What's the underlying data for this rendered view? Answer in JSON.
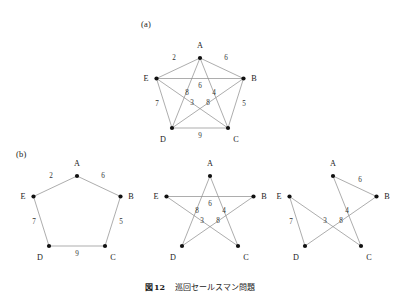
{
  "figure": {
    "caption_prefix": "図",
    "caption_number": "12",
    "caption_title": "巡回セールスマン問題",
    "panel_a_tag": "(a)",
    "panel_b_tag": "(b)",
    "ink_color": "#8a8a8a",
    "node_color": "#111111",
    "background": "#ffffff"
  },
  "chart_data": {
    "type": "diagram",
    "nodes": [
      "A",
      "B",
      "C",
      "D",
      "E"
    ],
    "panels": [
      {
        "id": "a",
        "tag": "(a)",
        "layout": "pentagon",
        "node_positions": {
          "A": [
            200,
            58
          ],
          "B": [
            243.5,
            78.5
          ],
          "C": [
            228,
            128
          ],
          "D": [
            172,
            128
          ],
          "E": [
            156.5,
            78.5
          ]
        },
        "edges": [
          {
            "from": "A",
            "to": "E",
            "weight": 2,
            "label_pos": [
              174,
              60
            ]
          },
          {
            "from": "A",
            "to": "B",
            "weight": 6,
            "label_pos": [
              226,
              60
            ]
          },
          {
            "from": "E",
            "to": "D",
            "weight": 7,
            "label_pos": [
              157,
              106
            ]
          },
          {
            "from": "B",
            "to": "C",
            "weight": 5,
            "label_pos": [
              244,
              106
            ]
          },
          {
            "from": "D",
            "to": "C",
            "weight": 9,
            "label_pos": [
              200,
              138
            ]
          },
          {
            "from": "A",
            "to": "C",
            "weight": 4,
            "label_pos": [
              214,
              95
            ]
          },
          {
            "from": "A",
            "to": "D",
            "weight": 8,
            "label_pos": [
              187,
              95
            ]
          },
          {
            "from": "B",
            "to": "E",
            "weight": 6,
            "label_pos": [
              200,
              88
            ]
          },
          {
            "from": "B",
            "to": "D",
            "weight": 8,
            "label_pos": [
              208,
              105
            ]
          },
          {
            "from": "C",
            "to": "E",
            "weight": 3,
            "label_pos": [
              192,
              105
            ]
          }
        ],
        "vertex_label_pos": {
          "A": [
            200,
            48
          ],
          "B": [
            254,
            81
          ],
          "C": [
            236,
            142
          ],
          "D": [
            163,
            142
          ],
          "E": [
            146,
            81
          ]
        }
      },
      {
        "id": "b-left",
        "tag": "(b)",
        "layout": "pentagon-cycle",
        "node_positions": {
          "A": [
            77,
            176
          ],
          "B": [
            120.5,
            196.5
          ],
          "C": [
            105,
            246
          ],
          "D": [
            49,
            246
          ],
          "E": [
            33.5,
            196.5
          ]
        },
        "edges": [
          {
            "from": "A",
            "to": "E",
            "weight": 2,
            "label_pos": [
              51,
              178
            ]
          },
          {
            "from": "A",
            "to": "B",
            "weight": 6,
            "label_pos": [
              103,
              178
            ]
          },
          {
            "from": "E",
            "to": "D",
            "weight": 7,
            "label_pos": [
              34,
              224
            ]
          },
          {
            "from": "B",
            "to": "C",
            "weight": 5,
            "label_pos": [
              121,
              224
            ]
          },
          {
            "from": "D",
            "to": "C",
            "weight": 9,
            "label_pos": [
              77,
              256
            ]
          }
        ],
        "vertex_label_pos": {
          "A": [
            77,
            166
          ],
          "B": [
            131,
            199
          ],
          "C": [
            113,
            260
          ],
          "D": [
            40,
            260
          ],
          "E": [
            23,
            199
          ]
        }
      },
      {
        "id": "b-middle",
        "tag": "",
        "layout": "pentagram",
        "node_positions": {
          "A": [
            210,
            176
          ],
          "B": [
            253.5,
            196.5
          ],
          "C": [
            238,
            246
          ],
          "D": [
            182,
            246
          ],
          "E": [
            166.5,
            196.5
          ]
        },
        "edges": [
          {
            "from": "A",
            "to": "C",
            "weight": 4,
            "label_pos": [
              224,
              213
            ]
          },
          {
            "from": "A",
            "to": "D",
            "weight": 8,
            "label_pos": [
              197,
              213
            ]
          },
          {
            "from": "B",
            "to": "E",
            "weight": 6,
            "label_pos": [
              210,
              206
            ]
          },
          {
            "from": "B",
            "to": "D",
            "weight": 8,
            "label_pos": [
              218,
              223
            ]
          },
          {
            "from": "C",
            "to": "E",
            "weight": 3,
            "label_pos": [
              202,
              223
            ]
          }
        ],
        "vertex_label_pos": {
          "A": [
            210,
            166
          ],
          "B": [
            264,
            199
          ],
          "C": [
            246,
            260
          ],
          "D": [
            173,
            260
          ],
          "E": [
            156,
            199
          ]
        }
      },
      {
        "id": "b-right",
        "tag": "",
        "layout": "tour",
        "node_positions": {
          "A": [
            333,
            176
          ],
          "B": [
            376.5,
            196.5
          ],
          "C": [
            361,
            246
          ],
          "D": [
            305,
            246
          ],
          "E": [
            289.5,
            196.5
          ]
        },
        "edges": [
          {
            "from": "A",
            "to": "B",
            "weight": 6,
            "label_pos": [
              360,
              182
            ]
          },
          {
            "from": "A",
            "to": "C",
            "weight": 4,
            "label_pos": [
              347,
              213
            ]
          },
          {
            "from": "B",
            "to": "D",
            "weight": 8,
            "label_pos": [
              341,
              223
            ]
          },
          {
            "from": "C",
            "to": "E",
            "weight": 3,
            "label_pos": [
              325,
              223
            ]
          },
          {
            "from": "E",
            "to": "D",
            "weight": 7,
            "label_pos": [
              291,
              224
            ]
          }
        ],
        "vertex_label_pos": {
          "A": [
            333,
            166
          ],
          "B": [
            387,
            199
          ],
          "C": [
            369,
            260
          ],
          "D": [
            296,
            260
          ],
          "E": [
            279,
            199
          ]
        }
      }
    ]
  }
}
